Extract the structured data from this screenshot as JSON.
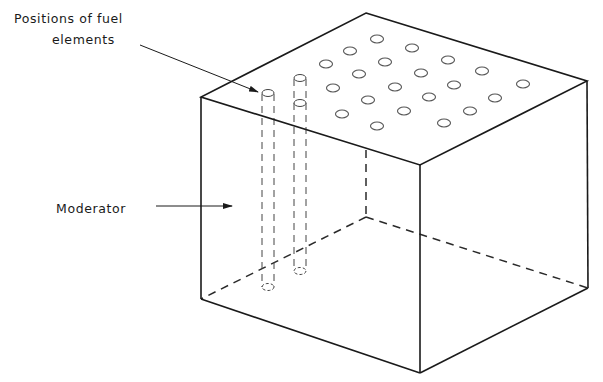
{
  "labels": {
    "fuel_positions_line1": "Positions of fuel",
    "fuel_positions_line2": "elements",
    "moderator": "Moderator"
  },
  "colors": {
    "background": "#ffffff",
    "line": "#1a1a1a",
    "hole": "#555555"
  },
  "cube": {
    "top_back": [
      366,
      13
    ],
    "top_left": [
      201,
      97
    ],
    "top_front": [
      420,
      165
    ],
    "top_right": [
      587,
      81
    ],
    "bottom_left": [
      201,
      299
    ],
    "bottom_front": [
      420,
      373
    ],
    "bottom_right": [
      588,
      288
    ],
    "bottom_back_hidden": [
      366,
      217
    ]
  },
  "holes": [
    [
      377,
      39
    ],
    [
      350,
      51
    ],
    [
      326,
      64
    ],
    [
      412,
      48
    ],
    [
      385,
      62
    ],
    [
      359,
      74
    ],
    [
      333,
      88
    ],
    [
      448,
      60
    ],
    [
      421,
      73
    ],
    [
      395,
      87
    ],
    [
      368,
      100
    ],
    [
      342,
      114
    ],
    [
      482,
      71
    ],
    [
      454,
      85
    ],
    [
      429,
      97
    ],
    [
      404,
      111
    ],
    [
      377,
      126
    ],
    [
      523,
      84
    ],
    [
      495,
      98
    ],
    [
      470,
      111
    ],
    [
      444,
      123
    ]
  ],
  "fuel_rods": [
    {
      "top": [
        268,
        92
      ],
      "bottom_y": 287
    },
    {
      "top": [
        300,
        78
      ],
      "bottom_y": 271,
      "extra_hole": [
        300,
        103
      ]
    }
  ]
}
